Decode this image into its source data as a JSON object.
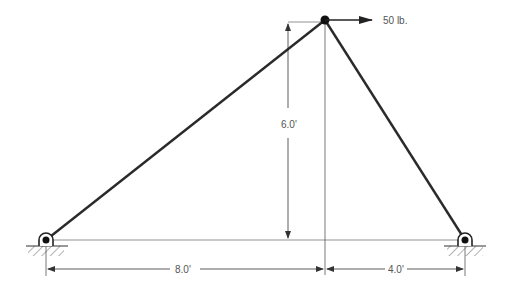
{
  "diagram": {
    "type": "truss",
    "load": {
      "label": "50 lb.",
      "direction": "right"
    },
    "dimensions": {
      "height": "6.0'",
      "left_span": "8.0'",
      "right_span": "4.0'"
    },
    "supports": [
      {
        "name": "left-pin-support",
        "type": "pin"
      },
      {
        "name": "right-pin-support",
        "type": "pin"
      }
    ],
    "colors": {
      "member": "#2a2a2a",
      "dimension": "#555555"
    }
  }
}
